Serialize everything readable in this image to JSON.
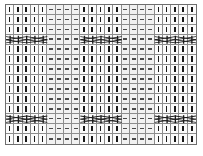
{
  "chart_data": {
    "type": "heatmap",
    "xlabel": "",
    "ylabel": "",
    "columns": 23,
    "rows": 14,
    "grid_color": "#8d8d8d",
    "border_color": "#6e6e6e",
    "symbol_color": "#1a1a1a",
    "purl_color": "#4a4a4a",
    "legend": [
      {
        "key": "knit",
        "symbol": "|",
        "label": "knit stitch (vertical bar)"
      },
      {
        "key": "purl",
        "symbol": "-",
        "label": "purl stitch (horizontal dash)"
      },
      {
        "key": "cable",
        "symbol": "X",
        "label": "cable cross (5-stitch)"
      }
    ],
    "column_groups": [
      {
        "type": "knit",
        "start": 1,
        "span": 5
      },
      {
        "type": "purl",
        "start": 6,
        "span": 4
      },
      {
        "type": "knit",
        "start": 10,
        "span": 5
      },
      {
        "type": "purl",
        "start": 15,
        "span": 4
      },
      {
        "type": "knit",
        "start": 19,
        "span": 5
      }
    ],
    "cable_rows": [
      {
        "row": 4,
        "cross_start_columns": [
          1,
          10,
          19
        ],
        "span": 5
      },
      {
        "row": 12,
        "cross_start_columns": [
          1,
          10,
          19
        ],
        "span": 5
      }
    ],
    "cells": [
      [
        "k",
        "k",
        "k",
        "k",
        "k",
        "p",
        "p",
        "p",
        "p",
        "k",
        "k",
        "k",
        "k",
        "k",
        "p",
        "p",
        "p",
        "p",
        "k",
        "k",
        "k",
        "k",
        "k"
      ],
      [
        "k",
        "k",
        "k",
        "k",
        "k",
        "p",
        "p",
        "p",
        "p",
        "k",
        "k",
        "k",
        "k",
        "k",
        "p",
        "p",
        "p",
        "p",
        "k",
        "k",
        "k",
        "k",
        "k"
      ],
      [
        "k",
        "k",
        "k",
        "k",
        "k",
        "p",
        "p",
        "p",
        "p",
        "k",
        "k",
        "k",
        "k",
        "k",
        "p",
        "p",
        "p",
        "p",
        "k",
        "k",
        "k",
        "k",
        "k"
      ],
      [
        "c",
        "c",
        "c",
        "c",
        "c",
        "p",
        "p",
        "p",
        "p",
        "c",
        "c",
        "c",
        "c",
        "c",
        "p",
        "p",
        "p",
        "p",
        "c",
        "c",
        "c",
        "c",
        "c"
      ],
      [
        "k",
        "k",
        "k",
        "k",
        "k",
        "p",
        "p",
        "p",
        "p",
        "k",
        "k",
        "k",
        "k",
        "k",
        "p",
        "p",
        "p",
        "p",
        "k",
        "k",
        "k",
        "k",
        "k"
      ],
      [
        "k",
        "k",
        "k",
        "k",
        "k",
        "p",
        "p",
        "p",
        "p",
        "k",
        "k",
        "k",
        "k",
        "k",
        "p",
        "p",
        "p",
        "p",
        "k",
        "k",
        "k",
        "k",
        "k"
      ],
      [
        "k",
        "k",
        "k",
        "k",
        "k",
        "p",
        "p",
        "p",
        "p",
        "k",
        "k",
        "k",
        "k",
        "k",
        "p",
        "p",
        "p",
        "p",
        "k",
        "k",
        "k",
        "k",
        "k"
      ],
      [
        "k",
        "k",
        "k",
        "k",
        "k",
        "p",
        "p",
        "p",
        "p",
        "k",
        "k",
        "k",
        "k",
        "k",
        "p",
        "p",
        "p",
        "p",
        "k",
        "k",
        "k",
        "k",
        "k"
      ],
      [
        "k",
        "k",
        "k",
        "k",
        "k",
        "p",
        "p",
        "p",
        "p",
        "k",
        "k",
        "k",
        "k",
        "k",
        "p",
        "p",
        "p",
        "p",
        "k",
        "k",
        "k",
        "k",
        "k"
      ],
      [
        "k",
        "k",
        "k",
        "k",
        "k",
        "p",
        "p",
        "p",
        "p",
        "k",
        "k",
        "k",
        "k",
        "k",
        "p",
        "p",
        "p",
        "p",
        "k",
        "k",
        "k",
        "k",
        "k"
      ],
      [
        "k",
        "k",
        "k",
        "k",
        "k",
        "p",
        "p",
        "p",
        "p",
        "k",
        "k",
        "k",
        "k",
        "k",
        "p",
        "p",
        "p",
        "p",
        "k",
        "k",
        "k",
        "k",
        "k"
      ],
      [
        "c",
        "c",
        "c",
        "c",
        "c",
        "p",
        "p",
        "p",
        "p",
        "c",
        "c",
        "c",
        "c",
        "c",
        "p",
        "p",
        "p",
        "p",
        "c",
        "c",
        "c",
        "c",
        "c"
      ],
      [
        "k",
        "k",
        "k",
        "k",
        "k",
        "p",
        "p",
        "p",
        "p",
        "k",
        "k",
        "k",
        "k",
        "k",
        "p",
        "p",
        "p",
        "p",
        "k",
        "k",
        "k",
        "k",
        "k"
      ],
      [
        "k",
        "k",
        "k",
        "k",
        "k",
        "p",
        "p",
        "p",
        "p",
        "k",
        "k",
        "k",
        "k",
        "k",
        "p",
        "p",
        "p",
        "p",
        "k",
        "k",
        "k",
        "k",
        "k"
      ]
    ]
  },
  "caption": {
    "text": ""
  }
}
